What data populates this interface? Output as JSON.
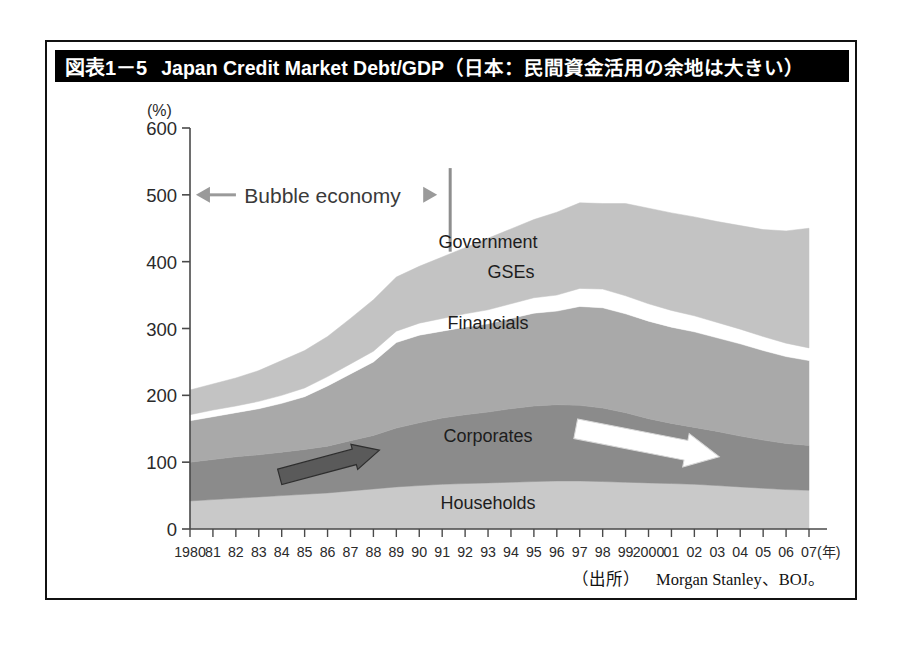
{
  "figure": {
    "number": "図表1－5",
    "title": "Japan Credit Market Debt/GDP（日本：民間資金活用の余地は大きい）",
    "source_tag": "（出所）",
    "source_text": "Morgan Stanley、BOJ。"
  },
  "annotations": {
    "bubble_label": "Bubble economy",
    "left_arrow_icon": "arrow-left-icon",
    "right_arrow_icon": "arrow-right-icon",
    "bubble_start_year": 1981,
    "bubble_end_year": 1991,
    "divider_year": 1991,
    "gray_arrow_icon": "trend-up-arrow-icon",
    "white_arrow_icon": "trend-down-arrow-icon"
  },
  "colors": {
    "government": "#c3c3c3",
    "gses": "#ffffff",
    "financials": "#a9a9a9",
    "corporates": "#8b8b8b",
    "households": "#c9c9c9",
    "title_bg": "#000000",
    "title_fg": "#ffffff",
    "axis": "#4a4a4a",
    "gray_arrow": "#5a5a5a",
    "white_arrow": "#ffffff"
  },
  "chart_data": {
    "type": "area",
    "title": "Japan Credit Market Debt/GDP",
    "xlabel": "(年)",
    "ylabel": "(%)",
    "ylim": [
      0,
      600
    ],
    "yticks": [
      0,
      100,
      200,
      300,
      400,
      500,
      600
    ],
    "grid": false,
    "legend": "inline-labels",
    "stacked": true,
    "x": [
      1980,
      1981,
      1982,
      1983,
      1984,
      1985,
      1986,
      1987,
      1988,
      1989,
      1990,
      1991,
      1992,
      1993,
      1994,
      1995,
      1996,
      1997,
      1998,
      1999,
      2000,
      2001,
      2002,
      2003,
      2004,
      2005,
      2006,
      2007
    ],
    "categories": [
      "1980",
      "81",
      "82",
      "83",
      "84",
      "85",
      "86",
      "87",
      "88",
      "89",
      "90",
      "91",
      "92",
      "93",
      "94",
      "95",
      "96",
      "97",
      "98",
      "99",
      "2000",
      "01",
      "02",
      "03",
      "04",
      "05",
      "06",
      "07"
    ],
    "series": [
      {
        "name": "Households",
        "color": "#c9c9c9",
        "values": [
          42,
          44,
          46,
          48,
          50,
          52,
          54,
          57,
          60,
          63,
          65,
          67,
          68,
          69,
          70,
          71,
          72,
          72,
          71,
          70,
          69,
          68,
          67,
          65,
          63,
          61,
          59,
          58
        ]
      },
      {
        "name": "Corporates",
        "color": "#8b8b8b",
        "values": [
          58,
          60,
          62,
          63,
          65,
          67,
          70,
          75,
          80,
          88,
          94,
          99,
          103,
          106,
          110,
          113,
          114,
          113,
          110,
          104,
          96,
          90,
          85,
          81,
          76,
          72,
          69,
          67
        ]
      },
      {
        "name": "Financials",
        "color": "#a9a9a9",
        "values": [
          62,
          64,
          66,
          69,
          73,
          79,
          90,
          100,
          110,
          128,
          131,
          130,
          131,
          132,
          135,
          139,
          140,
          148,
          150,
          148,
          146,
          144,
          143,
          140,
          138,
          134,
          130,
          127
        ]
      },
      {
        "name": "GSEs",
        "color": "#ffffff",
        "values": [
          9,
          10,
          10,
          11,
          12,
          13,
          14,
          15,
          16,
          17,
          18,
          19,
          20,
          21,
          22,
          23,
          24,
          27,
          28,
          27,
          26,
          25,
          24,
          23,
          22,
          21,
          20,
          19
        ]
      },
      {
        "name": "Government",
        "color": "#c3c3c3",
        "values": [
          37,
          39,
          42,
          46,
          52,
          56,
          60,
          68,
          77,
          81,
          85,
          92,
          99,
          107,
          112,
          117,
          124,
          128,
          128,
          138,
          143,
          146,
          148,
          151,
          155,
          160,
          168,
          179
        ]
      }
    ],
    "totals": [
      208,
      217,
      226,
      237,
      252,
      267,
      288,
      315,
      343,
      377,
      393,
      407,
      421,
      435,
      449,
      463,
      474,
      488,
      487,
      487,
      480,
      473,
      467,
      460,
      454,
      448,
      446,
      450
    ],
    "annotations": [
      {
        "text": "Government",
        "year": 1993,
        "value": 420
      },
      {
        "text": "GSEs",
        "year": 1994,
        "value": 375
      },
      {
        "text": "Financials",
        "year": 1993,
        "value": 300
      },
      {
        "text": "Corporates",
        "year": 1993,
        "value": 130
      },
      {
        "text": "Households",
        "year": 1993,
        "value": 30
      },
      {
        "text": "Bubble economy",
        "year": 1986,
        "value": 500
      }
    ]
  },
  "series_labels": {
    "government": "Government",
    "gses": "GSEs",
    "financials": "Financials",
    "corporates": "Corporates",
    "households": "Households"
  },
  "axis": {
    "y_unit": "(%)",
    "x_unit": "(年)",
    "y_ticks": [
      "600",
      "500",
      "400",
      "300",
      "200",
      "100",
      "0"
    ],
    "x_ticks": [
      "1980",
      "81",
      "82",
      "83",
      "84",
      "85",
      "86",
      "87",
      "88",
      "89",
      "90",
      "91",
      "92",
      "93",
      "94",
      "95",
      "96",
      "97",
      "98",
      "99",
      "2000",
      "01",
      "02",
      "03",
      "04",
      "05",
      "06",
      "07"
    ]
  }
}
